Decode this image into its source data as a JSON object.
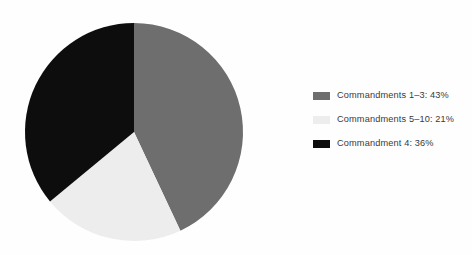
{
  "chart_data": {
    "type": "pie",
    "title": "",
    "subtitle": "",
    "xlabel": "",
    "ylabel": "",
    "grid": false,
    "legend_position": "right",
    "start_angle_deg": 0,
    "direction": "clockwise",
    "categories": [
      "Commandments 1–3",
      "Commandments 5–10",
      "Commandment 4"
    ],
    "values": [
      43,
      21,
      36
    ],
    "unit": "%",
    "colors": [
      "#6e6e6e",
      "#ededed",
      "#0d0d0d"
    ],
    "slices": [
      {
        "label": "Commandments 1–3",
        "value": 43,
        "legend_text": "Commandments 1–3: 43%",
        "color": "#6e6e6e",
        "start_angle_deg": 0,
        "end_angle_deg": 154.8
      },
      {
        "label": "Commandments 5–10",
        "value": 21,
        "legend_text": "Commandments 5–10: 21%",
        "color": "#ededed",
        "start_angle_deg": 154.8,
        "end_angle_deg": 230.4
      },
      {
        "label": "Commandment 4",
        "value": 36,
        "legend_text": "Commandment 4: 36%",
        "color": "#0d0d0d",
        "start_angle_deg": 230.4,
        "end_angle_deg": 360
      }
    ]
  },
  "legend": {
    "items": [
      {
        "text": "Commandments 1–3: 43%",
        "color": "#6e6e6e"
      },
      {
        "text": "Commandments 5–10: 21%",
        "color": "#ededed"
      },
      {
        "text": "Commandment 4: 36%",
        "color": "#0d0d0d"
      }
    ]
  },
  "geometry": {
    "center_x": 134,
    "center_y": 132,
    "radius": 109
  },
  "style": {
    "background": "#fefefe",
    "text_color": "#3a3a3a"
  }
}
